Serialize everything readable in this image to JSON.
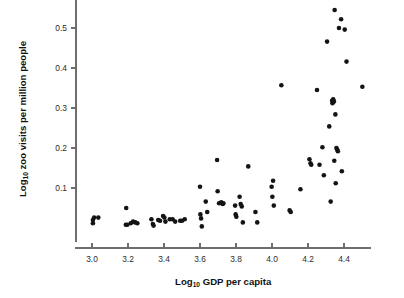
{
  "chart_data": {
    "type": "scatter",
    "title": "",
    "xlabel": "Log10 GDP per capita",
    "ylabel": "Log10 zoo visits per million people",
    "xlabel_parts": {
      "prefix": "Log",
      "sub": "10",
      "suffix": " GDP per capita"
    },
    "ylabel_parts": {
      "prefix": "Log",
      "sub": "10",
      "suffix": " zoo visits per million people"
    },
    "xlim": [
      2.93,
      4.55
    ],
    "ylim": [
      0.0,
      0.57
    ],
    "xticks": [
      3.0,
      3.2,
      3.4,
      3.6,
      3.8,
      4.0,
      4.2,
      4.4
    ],
    "xtick_labels": [
      "3.0",
      "3.2",
      "3.4",
      "3.6",
      "3.8",
      "4.0",
      "4.2",
      "4.4"
    ],
    "yticks": [
      0.1,
      0.2,
      0.3,
      0.4,
      0.5
    ],
    "ytick_labels": [
      "0.1",
      "0.2",
      "0.3",
      "0.4",
      "0.5"
    ],
    "grid": false,
    "legend": null,
    "marker": {
      "shape": "circle",
      "color": "#141414",
      "size_px": 4.6
    },
    "points": [
      [
        3.005,
        0.012
      ],
      [
        3.005,
        0.02
      ],
      [
        3.012,
        0.026
      ],
      [
        3.035,
        0.026
      ],
      [
        3.19,
        0.05
      ],
      [
        3.188,
        0.008
      ],
      [
        3.196,
        0.008
      ],
      [
        3.215,
        0.012
      ],
      [
        3.228,
        0.016
      ],
      [
        3.24,
        0.014
      ],
      [
        3.252,
        0.012
      ],
      [
        3.33,
        0.022
      ],
      [
        3.338,
        0.01
      ],
      [
        3.342,
        0.006
      ],
      [
        3.368,
        0.02
      ],
      [
        3.378,
        0.018
      ],
      [
        3.395,
        0.03
      ],
      [
        3.402,
        0.026
      ],
      [
        3.408,
        0.016
      ],
      [
        3.432,
        0.022
      ],
      [
        3.448,
        0.022
      ],
      [
        3.462,
        0.016
      ],
      [
        3.49,
        0.018
      ],
      [
        3.5,
        0.018
      ],
      [
        3.515,
        0.022
      ],
      [
        3.6,
        0.103
      ],
      [
        3.602,
        0.034
      ],
      [
        3.606,
        0.024
      ],
      [
        3.61,
        0.004
      ],
      [
        3.632,
        0.066
      ],
      [
        3.64,
        0.04
      ],
      [
        3.695,
        0.17
      ],
      [
        3.698,
        0.092
      ],
      [
        3.706,
        0.062
      ],
      [
        3.718,
        0.064
      ],
      [
        3.726,
        0.06
      ],
      [
        3.73,
        0.062
      ],
      [
        3.795,
        0.056
      ],
      [
        3.798,
        0.034
      ],
      [
        3.802,
        0.028
      ],
      [
        3.82,
        0.078
      ],
      [
        3.826,
        0.06
      ],
      [
        3.832,
        0.054
      ],
      [
        3.838,
        0.014
      ],
      [
        3.868,
        0.154
      ],
      [
        3.908,
        0.04
      ],
      [
        3.918,
        0.014
      ],
      [
        3.998,
        0.103
      ],
      [
        4.002,
        0.078
      ],
      [
        4.006,
        0.118
      ],
      [
        4.01,
        0.056
      ],
      [
        4.052,
        0.357
      ],
      [
        4.098,
        0.044
      ],
      [
        4.104,
        0.04
      ],
      [
        4.158,
        0.097
      ],
      [
        4.208,
        0.172
      ],
      [
        4.214,
        0.162
      ],
      [
        4.218,
        0.158
      ],
      [
        4.25,
        0.345
      ],
      [
        4.264,
        0.158
      ],
      [
        4.28,
        0.202
      ],
      [
        4.288,
        0.132
      ],
      [
        4.306,
        0.466
      ],
      [
        4.318,
        0.254
      ],
      [
        4.326,
        0.066
      ],
      [
        4.334,
        0.318
      ],
      [
        4.336,
        0.312
      ],
      [
        4.34,
        0.322
      ],
      [
        4.344,
        0.316
      ],
      [
        4.346,
        0.168
      ],
      [
        4.348,
        0.545
      ],
      [
        4.352,
        0.284
      ],
      [
        4.354,
        0.112
      ],
      [
        4.358,
        0.2
      ],
      [
        4.362,
        0.196
      ],
      [
        4.366,
        0.192
      ],
      [
        4.372,
        0.5
      ],
      [
        4.384,
        0.522
      ],
      [
        4.388,
        0.142
      ],
      [
        4.404,
        0.496
      ],
      [
        4.414,
        0.416
      ],
      [
        4.502,
        0.353
      ]
    ]
  }
}
